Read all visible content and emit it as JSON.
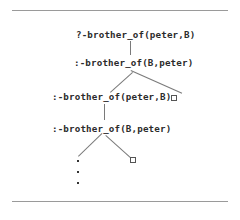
{
  "figure": {
    "title_text": "",
    "nodes": [
      {
        "id": "n1",
        "text": "?-brother_of(peter,B)"
      },
      {
        "id": "n2",
        "text": ":-brother_of(B,peter)"
      },
      {
        "id": "n3",
        "text": ":-brother_of(peter,B)"
      },
      {
        "id": "n4",
        "text": ":-brother_of(B,peter)"
      }
    ],
    "symbols": {
      "empty_clause_right_upper": "□",
      "empty_clause_right_lower": "□",
      "ellipsis": "•"
    },
    "colors": {
      "background": "#ffffff",
      "text": "#2b2b2b",
      "edge": "#7a7a7a",
      "rule": "#9a9a9a",
      "box_border": "#555555"
    }
  }
}
